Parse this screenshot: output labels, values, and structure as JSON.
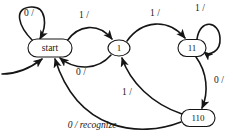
{
  "diagram": {
    "stroke_color": "#151515",
    "background_color": "#ffffff",
    "nodes": [
      {
        "id": "start",
        "label": "start",
        "cx": 50,
        "cy": 48,
        "rx": 22,
        "ry": 9,
        "shape": "stadium",
        "font_size": 9.5
      },
      {
        "id": "s1",
        "label": "1",
        "cx": 119,
        "cy": 48,
        "rx": 11,
        "ry": 8,
        "shape": "ellipse",
        "font_size": 9
      },
      {
        "id": "s11",
        "label": "11",
        "cx": 192,
        "cy": 48,
        "rx": 14,
        "ry": 8.5,
        "shape": "stadium",
        "font_size": 9
      },
      {
        "id": "s110",
        "label": "110",
        "cx": 198,
        "cy": 118,
        "rx": 17,
        "ry": 8.5,
        "shape": "stadium",
        "font_size": 9
      }
    ],
    "edges": [
      {
        "id": "start-self",
        "from": "start",
        "to": "start",
        "label": "0 /",
        "lx": 29,
        "ly": 14,
        "italic": false
      },
      {
        "id": "start-to-1",
        "from": "start",
        "to": "s1",
        "label": "1 /",
        "lx": 84,
        "ly": 16,
        "italic": false
      },
      {
        "id": "1-to-start",
        "from": "s1",
        "to": "start",
        "label": "0 /",
        "lx": 81,
        "ly": 73,
        "italic": false
      },
      {
        "id": "1-to-11",
        "from": "s1",
        "to": "s11",
        "label": "1 /",
        "lx": 155,
        "ly": 14,
        "italic": false
      },
      {
        "id": "11-self",
        "from": "s11",
        "to": "s11",
        "label": "1 /",
        "lx": 200,
        "ly": 9,
        "italic": false
      },
      {
        "id": "11-to-110",
        "from": "s11",
        "to": "s110",
        "label": "0 /",
        "lx": 219,
        "ly": 81,
        "italic": false
      },
      {
        "id": "110-to-1",
        "from": "s110",
        "to": "s1",
        "label": "1 /",
        "lx": 127,
        "ly": 93,
        "italic": false
      },
      {
        "id": "110-to-start",
        "from": "s110",
        "to": "start",
        "label": "0 / recognize",
        "lx": 92,
        "ly": 126,
        "italic": true
      }
    ],
    "initial_arrow": {
      "id": "initial-state-arrow",
      "from_x": 2,
      "from_y": 74,
      "to_x": 44,
      "to_y": 58
    }
  }
}
